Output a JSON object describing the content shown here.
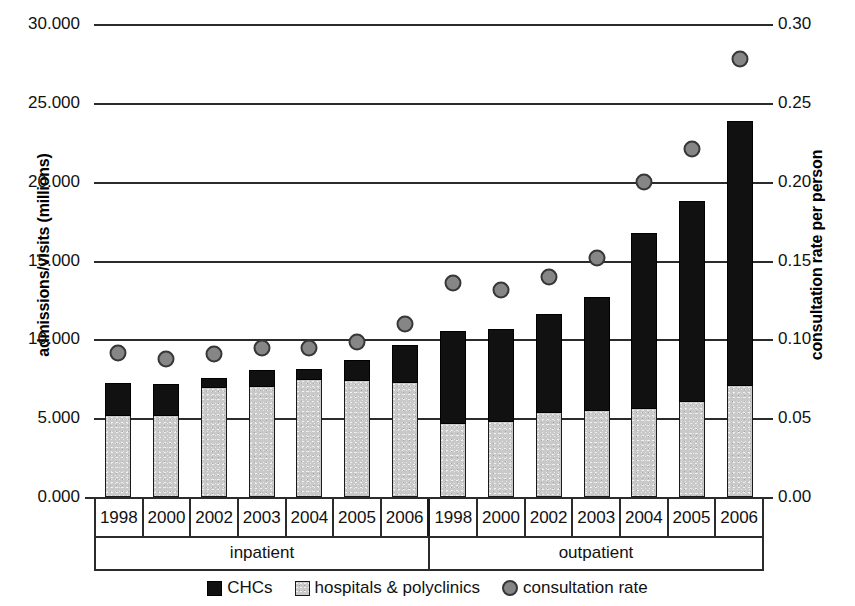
{
  "chart_data": {
    "type": "bar",
    "title": "",
    "subtitle": "",
    "ylabel": "admissions/visits (millions)",
    "ylabel_right": "consultation rate per person",
    "xlabel": "",
    "grid": true,
    "legend_position": "bottom",
    "ylim": [
      0,
      30
    ],
    "ylim_right": [
      0,
      0.3
    ],
    "ytick_labels": [
      "0.000",
      "5.000",
      "10.000",
      "15.000",
      "20.000",
      "25.000",
      "30.000"
    ],
    "ytick_values": [
      0,
      5,
      10,
      15,
      20,
      25,
      30
    ],
    "ytick_labels_right": [
      "0.00",
      "0.05",
      "0.10",
      "0.15",
      "0.20",
      "0.25",
      "0.30"
    ],
    "ytick_values_right": [
      0,
      0.05,
      0.1,
      0.15,
      0.2,
      0.25,
      0.3
    ],
    "groups": [
      "inpatient",
      "outpatient"
    ],
    "categories": [
      "1998",
      "2000",
      "2002",
      "2003",
      "2004",
      "2005",
      "2006",
      "1998",
      "2000",
      "2002",
      "2003",
      "2004",
      "2005",
      "2006"
    ],
    "series": [
      {
        "name": "hospitals & polyclinics",
        "color": "#c9c9c9",
        "values": [
          5.2,
          5.2,
          6.95,
          7.05,
          7.5,
          7.4,
          7.3,
          4.7,
          4.85,
          5.4,
          5.5,
          5.65,
          6.1,
          7.1
        ]
      },
      {
        "name": "CHCs",
        "color": "#111111",
        "values": [
          2.1,
          2.05,
          0.65,
          1.05,
          0.7,
          1.35,
          2.4,
          5.9,
          5.85,
          6.3,
          7.25,
          11.15,
          12.75,
          16.8
        ]
      },
      {
        "name": "consultation rate",
        "color": "#868686",
        "axis": "right",
        "values": [
          0.097,
          0.093,
          0.096,
          0.1,
          0.1,
          0.104,
          0.115,
          0.141,
          0.137,
          0.145,
          0.157,
          0.205,
          0.226,
          0.283
        ]
      }
    ],
    "totals": [
      7.3,
      7.25,
      7.6,
      8.1,
      8.2,
      8.75,
      9.7,
      10.6,
      10.7,
      11.7,
      12.75,
      16.8,
      18.85,
      23.9
    ]
  },
  "legend": {
    "items": [
      {
        "label": "CHCs",
        "marker": "square-black"
      },
      {
        "label": "hospitals & polyclinics",
        "marker": "square-gray"
      },
      {
        "label": "consultation rate",
        "marker": "circle-gray"
      }
    ]
  }
}
